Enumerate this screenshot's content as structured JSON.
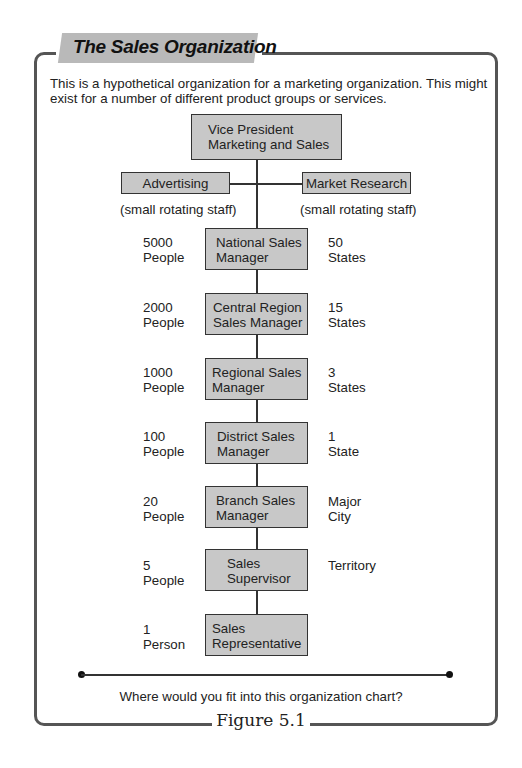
{
  "title": "The Sales Organization",
  "intro": "This is a hypothetical organization for a marketing organization. This might exist for a number of different product groups or services.",
  "top": {
    "vp": [
      "Vice President",
      "Marketing and Sales"
    ],
    "staff": [
      {
        "label": "Advertising",
        "note": "(small rotating staff)"
      },
      {
        "label": "Market Research",
        "note": "(small rotating staff)"
      }
    ]
  },
  "levels": [
    {
      "title": [
        "National Sales",
        "Manager"
      ],
      "people": [
        "5000",
        "People"
      ],
      "scope": [
        "50",
        "States"
      ]
    },
    {
      "title": [
        "Central Region",
        "Sales Manager"
      ],
      "people": [
        "2000",
        "People"
      ],
      "scope": [
        "15",
        "States"
      ]
    },
    {
      "title": [
        "Regional Sales",
        "Manager"
      ],
      "people": [
        "1000",
        "People"
      ],
      "scope": [
        "3",
        "States"
      ]
    },
    {
      "title": [
        "District Sales",
        "Manager"
      ],
      "people": [
        "100",
        "People"
      ],
      "scope": [
        "1",
        "State"
      ]
    },
    {
      "title": [
        "Branch Sales",
        "Manager"
      ],
      "people": [
        "20",
        "People"
      ],
      "scope": [
        "Major",
        "City"
      ]
    },
    {
      "title": [
        "Sales",
        "Supervisor"
      ],
      "people": [
        "5",
        "People"
      ],
      "scope": [
        "Territory",
        ""
      ]
    },
    {
      "title": [
        "Sales",
        "Representative"
      ],
      "people": [
        "1",
        "Person"
      ],
      "scope": [
        "",
        ""
      ]
    }
  ],
  "question": "Where would you fit into this organization chart?",
  "figure_label": "Figure 5.1",
  "colors": {
    "box_fill": "#c8c8c8",
    "banner": "#b9b9b9",
    "frame": "#555555"
  }
}
